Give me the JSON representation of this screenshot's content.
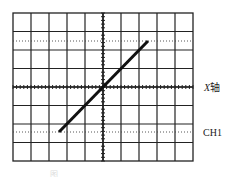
{
  "figure": {
    "labels": {
      "x_axis_prefix": "X",
      "x_axis_suffix": "轴",
      "channel": "CH1"
    },
    "caption": "图",
    "grid": {
      "columns": 10,
      "rows": 8,
      "left": 13,
      "top": 13,
      "right": 193,
      "bottom": 161,
      "line_color": "#222222"
    },
    "center": {
      "x": 103,
      "y": 87
    },
    "dotted_guides_y": [
      41,
      132
    ],
    "trace": {
      "start": {
        "x": 59,
        "y": 132
      },
      "end": {
        "x": 148,
        "y": 41
      },
      "color": "#111111",
      "width": 3
    }
  }
}
